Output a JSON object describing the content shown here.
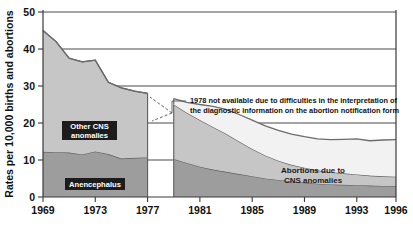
{
  "chart_data": {
    "type": "area",
    "title": "",
    "subtitle": "",
    "xlabel": "",
    "ylabel": "Rates per 10,000 births and abortions",
    "xlim": [
      1969,
      1996
    ],
    "ylim": [
      0,
      50
    ],
    "grid": true,
    "legend_position": "inline-labels",
    "stacked": true,
    "x": [
      1969,
      1970,
      1971,
      1972,
      1973,
      1974,
      1975,
      1976,
      1977,
      1978,
      1979,
      1980,
      1981,
      1982,
      1983,
      1984,
      1985,
      1986,
      1987,
      1988,
      1989,
      1990,
      1991,
      1992,
      1993,
      1994,
      1995,
      1996
    ],
    "xticks": [
      1969,
      1973,
      1977,
      1981,
      1985,
      1989,
      1993,
      1996
    ],
    "xtick_labels": [
      "1969",
      "1973",
      "1977",
      "1981",
      "1985",
      "1989",
      "1993",
      "1996"
    ],
    "yticks": [
      0,
      10,
      20,
      30,
      40,
      50
    ],
    "ytick_labels": [
      "0",
      "10",
      "20",
      "30",
      "40",
      "50"
    ],
    "missing_year": 1978,
    "series": [
      {
        "name": "Anencephalus",
        "label": "Anencephalus",
        "color": "#9d9d9d",
        "values": [
          12.2,
          12.1,
          12.0,
          11.5,
          12.3,
          11.6,
          10.4,
          10.6,
          10.7,
          null,
          10.3,
          9.2,
          8.2,
          7.4,
          6.8,
          6.2,
          5.6,
          5.0,
          4.6,
          4.2,
          3.9,
          3.6,
          3.4,
          3.3,
          3.2,
          3.1,
          3.0,
          3.0
        ]
      },
      {
        "name": "Other CNS anomalies",
        "label": "Other CNS anomalies",
        "color": "#c6c6c6",
        "values": [
          32.8,
          29.9,
          25.5,
          25.0,
          24.7,
          19.4,
          19.1,
          18.0,
          17.3,
          null,
          14.7,
          13.6,
          12.6,
          11.5,
          10.3,
          8.8,
          7.4,
          6.2,
          5.2,
          4.5,
          4.0,
          3.6,
          3.3,
          3.1,
          2.9,
          2.7,
          2.6,
          2.5
        ]
      },
      {
        "name": "Abortions due to CNS anomalies",
        "label": "Abortions due to CNS anomalies",
        "color": "#f2f2f2",
        "values": [
          0,
          0,
          0,
          0,
          0,
          0,
          0,
          0,
          0,
          null,
          1.6,
          2.8,
          4.2,
          5.6,
          6.6,
          7.3,
          7.8,
          8.0,
          8.2,
          8.3,
          8.4,
          8.5,
          8.8,
          9.2,
          9.6,
          9.4,
          9.8,
          10.0
        ]
      }
    ],
    "totals": [
      45.0,
      42.0,
      37.5,
      36.5,
      37.0,
      31.0,
      29.5,
      28.6,
      28.0,
      null,
      26.6,
      25.6,
      25.0,
      24.5,
      23.7,
      22.3,
      20.8,
      19.2,
      18.0,
      17.0,
      16.3,
      15.7,
      15.5,
      15.6,
      15.7,
      15.2,
      15.4,
      15.5
    ],
    "annotations": [
      {
        "name": "missing-data-note",
        "line1": "1978 not available due to difficulties in the interpretation of",
        "line2": "the diagnostic information on the abortion notification form"
      }
    ]
  },
  "labels": {
    "anencephalus": "Anencephalus",
    "other_cns": "Other CNS",
    "other_cns_2": "anomalies",
    "abortions": "Abortions due to",
    "abortions_2": "CNS anomalies"
  },
  "axis": {
    "y_title": "Rates per 10,000 births and abortions",
    "y_ticks": [
      "50",
      "40",
      "30",
      "20",
      "10",
      "0"
    ],
    "x_ticks": [
      "1969",
      "1973",
      "1977",
      "1981",
      "1985",
      "1989",
      "1993",
      "1996"
    ]
  },
  "note": {
    "line1": "1978 not available due to difficulties in the interpretation of",
    "line2": "the diagnostic information on the abortion notification form"
  },
  "colors": {
    "band_bottom": "#9d9d9d",
    "band_middle": "#c6c6c6",
    "band_top": "#f2f2f2",
    "outline": "#5d5d5d",
    "axis": "#3a3a3a"
  }
}
